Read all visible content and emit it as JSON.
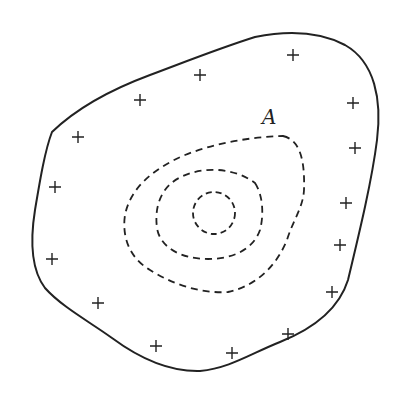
{
  "diagram": {
    "label": "A",
    "stroke_color": "#222222",
    "background": "#ffffff",
    "plus_marks": [
      [
        293,
        55
      ],
      [
        200,
        75
      ],
      [
        140,
        100
      ],
      [
        353,
        103
      ],
      [
        78,
        137
      ],
      [
        355,
        148
      ],
      [
        55,
        187
      ],
      [
        346,
        203
      ],
      [
        340,
        245
      ],
      [
        52,
        259
      ],
      [
        332,
        292
      ],
      [
        98,
        303
      ],
      [
        288,
        334
      ],
      [
        156,
        346
      ],
      [
        232,
        353
      ]
    ],
    "contours": [
      "outer-dashed",
      "middle-dashed",
      "inner-dashed"
    ]
  }
}
